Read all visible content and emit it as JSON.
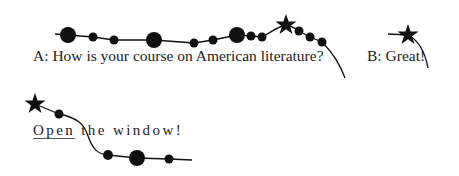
{
  "diagram": {
    "example_a": {
      "speaker_a": "A: How is your course on American literature?",
      "speaker_b": "B: Great!"
    },
    "example_b": {
      "underlined_word": "Open",
      "rest": " the window!"
    },
    "legend_semantics": {
      "large_dot": "stressed syllable",
      "small_dot": "unstressed syllable",
      "star": "nuclear stress / focus"
    },
    "colors": {
      "ink": "#111111",
      "text": "#222222",
      "background": "#ffffff"
    }
  }
}
